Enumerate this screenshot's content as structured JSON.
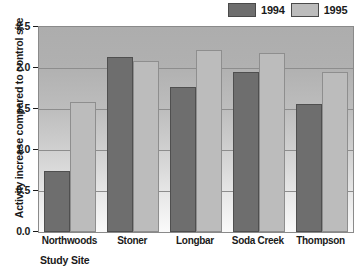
{
  "chart_data": {
    "type": "bar",
    "title": "",
    "xlabel": "Study Site",
    "ylabel": "Activity increase compared to control site",
    "categories": [
      "Northwoods",
      "Stoner",
      "Longbar",
      "Soda Creek",
      "Thompson"
    ],
    "series": [
      {
        "name": "1994",
        "color": "#6e6e6e",
        "values": [
          0.74,
          2.13,
          1.77,
          1.95,
          1.56
        ]
      },
      {
        "name": "1995",
        "color": "#bcbcbc",
        "values": [
          1.58,
          2.09,
          2.22,
          2.18,
          1.95
        ]
      }
    ],
    "ylim": [
      0.0,
      2.5
    ],
    "ytick_labels": [
      "0.0",
      "0.5",
      "1.0",
      "1.5",
      "2.0",
      "2.5"
    ],
    "ytick_values": [
      0.0,
      0.5,
      1.0,
      1.5,
      2.0,
      2.5
    ],
    "grid": true,
    "legend_position": "top-right",
    "plot_background": "gray-gradient"
  },
  "legend": {
    "entries": [
      {
        "label": "1994",
        "color": "#6e6e6e"
      },
      {
        "label": "1995",
        "color": "#bcbcbc"
      }
    ]
  }
}
